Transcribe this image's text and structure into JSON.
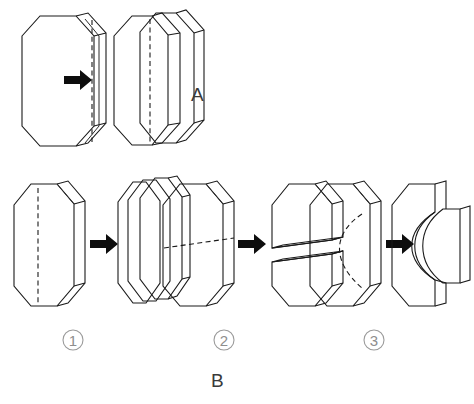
{
  "figure": {
    "background_color": "#ffffff",
    "line_color": "#1a1a1a",
    "label_color": "#3a3a3a",
    "step_label_color": "#8e8e8e",
    "arrow_color": "#0d0d0d"
  },
  "panels": [
    {
      "id": "A",
      "letter": "A",
      "description": "Octagonal prism block split lengthwise into two slabs",
      "cut_type": "longitudinal-straight",
      "source_shape": "octagonal-prism",
      "result_pieces": 2,
      "arrow": "right-arrow"
    },
    {
      "id": "B",
      "letter": "B",
      "description": "Three sectioning operations on an octagonal prism block",
      "steps": [
        {
          "number": "1",
          "marker": "①",
          "description": "Longitudinal cut producing thin parallel slabs",
          "cut_type": "longitudinal-straight",
          "result_pieces": 3,
          "arrow": "right-arrow"
        },
        {
          "number": "2",
          "marker": "②",
          "description": "Transverse cut separating block into upper and lower halves",
          "cut_type": "transverse-straight",
          "result_pieces": 2,
          "arrow": "right-arrow"
        },
        {
          "number": "3",
          "marker": "③",
          "description": "Curved cut producing a concave body and a lens shaped piece",
          "cut_type": "curved",
          "result_pieces": 2,
          "arrow": "right-arrow"
        }
      ]
    }
  ],
  "labels": {
    "panel_a": "A",
    "panel_b": "B",
    "step_1": "1",
    "step_2": "2",
    "step_3": "3"
  }
}
